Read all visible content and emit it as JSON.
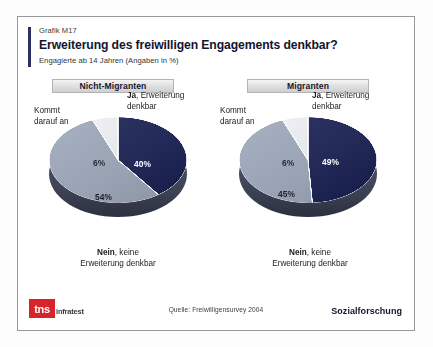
{
  "slide": {
    "graph_id": "Grafik M17",
    "title": "Erweiterung des freiwilligen Engagements denkbar?",
    "subtitle": "Engagierte ab 14 Jahren (Angaben in %)",
    "accent_color": "#2a3160"
  },
  "footer": {
    "logo_mark": "tns",
    "logo_word": "infratest",
    "logo_color": "#d8232a",
    "source": "Quelle: Freiwilligensurvey 2004",
    "department": "Sozialforschung"
  },
  "labels": {
    "ja_bold": "Ja",
    "ja_rest": ", Erweiterung",
    "ja_line2": "denkbar",
    "kommt_line1": "Kommt",
    "kommt_line2": "darauf an",
    "nein_bold": "Nein",
    "nein_rest": ", keine",
    "nein_line2": "Erweiterung denkbar"
  },
  "chart_data": [
    {
      "type": "pie",
      "title": "Nicht-Migranten",
      "categories": [
        "Ja, Erweiterung denkbar",
        "Nein, keine Erweiterung denkbar",
        "Kommt darauf an"
      ],
      "values": [
        40,
        54,
        6
      ],
      "value_labels": [
        "40%",
        "54%",
        "6%"
      ],
      "colors": [
        "#232a57",
        "#9aa3b4",
        "#e3e5e9"
      ],
      "legend": "callout",
      "unit": "%"
    },
    {
      "type": "pie",
      "title": "Migranten",
      "categories": [
        "Ja, Erweiterung denkbar",
        "Nein, keine Erweiterung denkbar",
        "Kommt darauf an"
      ],
      "values": [
        49,
        45,
        6
      ],
      "value_labels": [
        "49%",
        "45%",
        "6%"
      ],
      "colors": [
        "#232a57",
        "#9aa3b4",
        "#e3e5e9"
      ],
      "legend": "callout",
      "unit": "%"
    }
  ]
}
